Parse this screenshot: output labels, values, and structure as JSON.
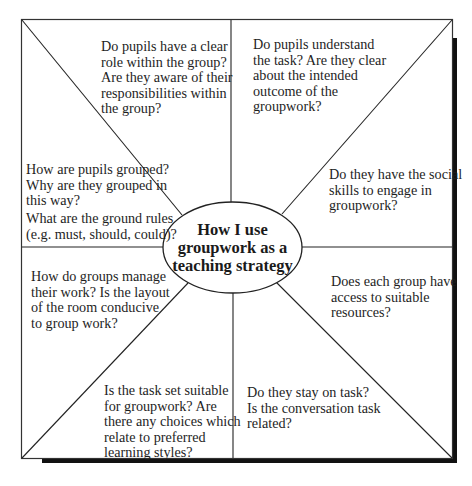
{
  "diagram": {
    "title": "How I use\ngroupwork as a\nteaching strategy",
    "colors": {
      "line": "#222222",
      "shadow": "#111111",
      "background": "#ffffff",
      "text": "#1e1e1e"
    },
    "segments": [
      {
        "id": "top-left",
        "text": "Do pupils have a clear\nrole within the group?\nAre they aware of their\n    responsibilities within\n      the group?"
      },
      {
        "id": "top-right",
        "text": "Do pupils understand\nthe task? Are they clear\nabout the intended\noutcome of the\ngroupwork?"
      },
      {
        "id": "right-upper",
        "text": "Do they have the social\nskills to engage in\ngroupwork?"
      },
      {
        "id": "right-lower",
        "text": "Does each group have\naccess to suitable\nresources?"
      },
      {
        "id": "bottom-right",
        "text": "Do they stay on task?\nIs the conversation task\nrelated?"
      },
      {
        "id": "bottom-left",
        "text": "Is the task set suitable\nfor groupwork? Are\nthere any choices which\nrelate to preferred\nlearning styles?"
      },
      {
        "id": "left-lower",
        "text": "How do groups manage\ntheir work? Is the layout\nof the room conducive\nto group work?"
      },
      {
        "id": "left-upper-a",
        "text": "How are pupils grouped?\nWhy are they grouped in\nthis way?"
      },
      {
        "id": "left-upper-b",
        "text": "What are the ground rules\n(e.g. must, should, could)?"
      }
    ]
  }
}
